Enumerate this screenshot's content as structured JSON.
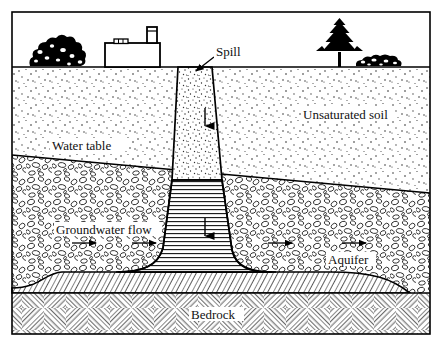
{
  "figure": {
    "type": "cross-section-diagram",
    "frame": {
      "border_color": "#000000"
    },
    "background_color": "#ffffff"
  },
  "labels": {
    "spill": "Spill",
    "unsaturated_soil": "Unsaturated soil",
    "water_table": "Water table",
    "groundwater_flow": "Groundwater flow",
    "aquifer": "Aquifer",
    "bedrock": "Bedrock"
  },
  "surface_features": [
    {
      "name": "shrub-cluster",
      "label": "",
      "x": 28,
      "y": 67,
      "width": 62,
      "height": 28
    },
    {
      "name": "factory-building",
      "label": "",
      "x": 105,
      "y": 67,
      "width": 55,
      "height": 24
    },
    {
      "name": "smokestack",
      "label": "",
      "x": 147,
      "y": 30,
      "width": 10,
      "height": 37
    },
    {
      "name": "conifer-tree",
      "label": "",
      "x": 325,
      "y": 67,
      "width": 32,
      "height": 45
    },
    {
      "name": "hedge-row",
      "label": "",
      "x": 355,
      "y": 67,
      "width": 48,
      "height": 10
    }
  ],
  "strata": [
    {
      "name": "sky-air",
      "fill": "#ffffff",
      "pattern": "none",
      "top_y": 12,
      "bottom_y": 67
    },
    {
      "name": "unsaturated-soil",
      "fill": "#ffffff",
      "pattern": "fine-stipple-dots",
      "top_y": 67,
      "bottom_y_left": 155,
      "bottom_y_right": 193
    },
    {
      "name": "aquifer-saturated",
      "fill": "#ffffff",
      "pattern": "rounded-gravel-clasts",
      "top_y_left": 155,
      "top_y_right": 193,
      "bottom_y": 293
    },
    {
      "name": "dnapl-pool-layer",
      "fill": "#ffffff",
      "pattern": "dense-diagonal-hatch",
      "top_y": 277,
      "bottom_y": 293
    },
    {
      "name": "bedrock",
      "fill": "#ffffff",
      "pattern": "cross-hatch-basketweave",
      "top_y": 293,
      "bottom_y": 334
    }
  ],
  "plume": {
    "name": "contaminant-plume",
    "vadose_segment": {
      "pattern": "stipple-dots",
      "top_width": 34,
      "bottom_width": 50,
      "top_y": 67,
      "bottom_y": 180
    },
    "saturated_segment": {
      "pattern": "horizontal-lines",
      "top_y": 180,
      "bottom_y": 277,
      "flares_outward": true
    },
    "downward_arrows": [
      {
        "x": 205,
        "y_start": 108,
        "y_end": 130
      },
      {
        "x": 205,
        "y_start": 218,
        "y_end": 240
      }
    ]
  },
  "flow_arrows": [
    {
      "name": "groundwater-arrow-1",
      "x": 72,
      "y": 243,
      "direction": "right",
      "length": 26
    },
    {
      "name": "groundwater-arrow-2",
      "x": 132,
      "y": 243,
      "direction": "right",
      "length": 26
    },
    {
      "name": "groundwater-arrow-3",
      "x": 268,
      "y": 243,
      "direction": "right",
      "length": 26
    },
    {
      "name": "groundwater-arrow-4",
      "x": 342,
      "y": 243,
      "direction": "right",
      "length": 26
    }
  ],
  "leader_lines": [
    {
      "name": "spill-leader",
      "from_x": 214,
      "from_y": 56,
      "to_x": 196,
      "to_y": 72
    }
  ],
  "colors": {
    "ink": "#000000",
    "paper": "#ffffff",
    "label_halo": "#ffffff"
  }
}
